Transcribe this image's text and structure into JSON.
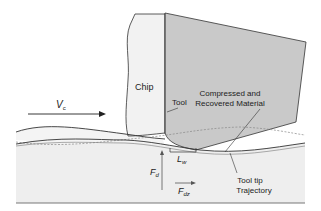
{
  "diagram": {
    "labels": {
      "chip": "Chip",
      "tool": "Tool",
      "vc_main": "V",
      "vc_sub": "c",
      "compressed_line1": "Compressed and",
      "compressed_line2": "Recovered Material",
      "lw_main": "L",
      "lw_sub": "w",
      "fd_main": "F",
      "fd_sub": "d",
      "fdz_main": "F",
      "fdz_sub": "dz",
      "trajectory_line1": "Tool tip",
      "trajectory_line2": "Trajectory"
    },
    "colors": {
      "tool_fill": "#c9c9c9",
      "chip_fill": "#f2f2f2",
      "workpiece_fill": "#eeeeee",
      "line": "#333333",
      "dashed": "#888888"
    }
  }
}
